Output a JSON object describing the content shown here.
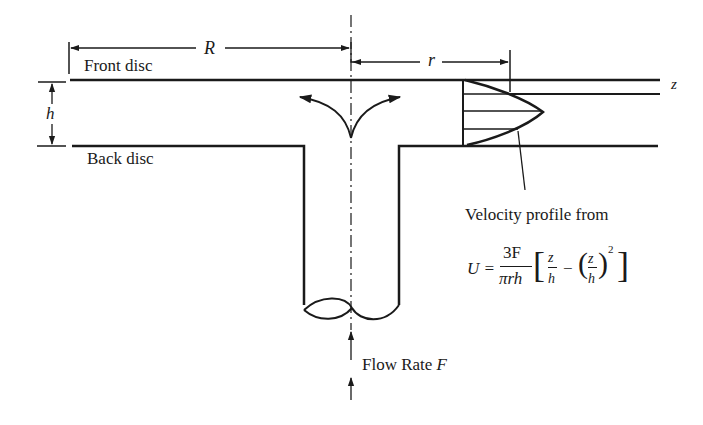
{
  "diagram": {
    "labels": {
      "front_disc": "Front disc",
      "back_disc": "Back disc",
      "R": "R",
      "r": "r",
      "h": "h",
      "z": "z",
      "velocity_caption": "Velocity profile from",
      "flow_rate": "Flow Rate ",
      "flow_rate_symbol": "F"
    },
    "equation": {
      "lhs": "U =",
      "frac_num": "3F",
      "frac_den": "πrh",
      "z1": "z",
      "h1": "h",
      "minus": "−",
      "z2": "z",
      "h2": "h",
      "exp": "2"
    },
    "colors": {
      "ink": "#1a1a1a",
      "background": "#ffffff"
    }
  }
}
